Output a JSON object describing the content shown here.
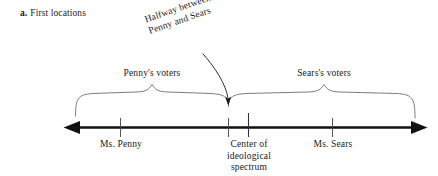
{
  "figure": {
    "caption_letter": "a.",
    "caption_text": "First locations",
    "pointer_annotation": {
      "line1": "Halfway between",
      "line2": "Penny and Sears"
    },
    "brace_labels": {
      "left": "Penny's voters",
      "right": "Sears's voters"
    },
    "axis": {
      "tick_labels": {
        "penny": "Ms. Penny",
        "center_line1": "Center of",
        "center_line2": "ideological",
        "center_line3": "spectrum",
        "sears": "Ms. Sears"
      }
    },
    "colors": {
      "background": "#ffffff",
      "ink": "#1a1a1a",
      "brace": "#6e6e6e",
      "axis": "#111111"
    }
  }
}
